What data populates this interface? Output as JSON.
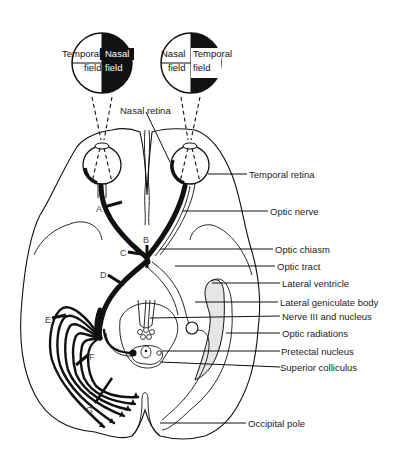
{
  "diagram": {
    "visual_fields": {
      "left_eye": {
        "outer_label": "Temporal",
        "outer_sub": "field",
        "inner_label": "Nasal",
        "inner_sub": "field"
      },
      "right_eye": {
        "inner_label": "Nasal",
        "inner_sub": "field",
        "outer_label": "Temporal",
        "outer_sub": "field"
      }
    },
    "labels": {
      "nasal_retina": "Nasal retina",
      "temporal_retina": "Temporal retina",
      "optic_nerve": "Optic nerve",
      "optic_chiasm": "Optic chiasm",
      "optic_tract": "Optic tract",
      "lateral_ventricle": "Lateral ventricle",
      "lateral_geniculate_body": "Lateral geniculate body",
      "nerve_iii": "Nerve III and nucleus",
      "optic_radiations": "Optic radiations",
      "pretectal_nucleus": "Pretectal nucleus",
      "superior_colliculus": "Superior colliculus",
      "occipital_pole": "Occipital pole"
    },
    "lesion_markers": [
      "A",
      "B",
      "C",
      "D",
      "E",
      "F",
      "G"
    ],
    "colors": {
      "line": "#111111",
      "ventricle_fill": "#e6e6e6",
      "field_dark": "#111111",
      "background": "#ffffff"
    }
  }
}
